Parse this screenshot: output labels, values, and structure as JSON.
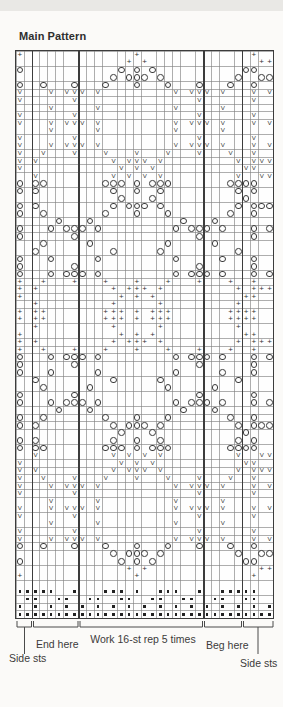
{
  "title": "Main Pattern",
  "labels": {
    "end_here": "End here",
    "repeat": "Work 16-st rep 5 times",
    "beg_here": "Beg here",
    "side_sts_left": "Side sts",
    "side_sts_right": "Side sts"
  },
  "chart_data": {
    "type": "knitting-chart",
    "title": "Main Pattern",
    "columns": 33,
    "rows": 75,
    "stitch_repeat": {
      "start_col": 9,
      "end_col": 24,
      "width_sts": 16,
      "label": "Work 16-st rep 5 times"
    },
    "side_stitches": {
      "left_cols": "1-2",
      "right_cols": "30-33"
    },
    "end_here_cols": "3-8",
    "beg_here_cols": "25-29",
    "bold_lines_after_cols": [
      2,
      8,
      24,
      29
    ],
    "symbol_key": {
      ".": "empty",
      "+": "plus-symbol",
      "o": "circle-symbol",
      "v": "v-symbol",
      "#": "dot-symbol"
    },
    "glyph_map": {
      "+": "+",
      "v": "V"
    },
    "grid_rows": [
      "+..............+..............+..",
      "..............+.+..............++",
      "o............o.o.o...........oo..",
      "............o.ooo.o.........o..oo",
      "o..o...o...o...o...o...o...o..o..",
      "v...v.vvv.v.........v.vvv.v...v.v",
      "v......v...............v......v..",
      "....v.....v.........v.....v......",
      "v......v...............v......v..",
      "v...v.vvv.v.........v.vvv.v...v.v",
      "....v.....v.........v.....v......",
      "v......v...............v......v..",
      "v...v.vvv.v.........v.vvv.v...v.v",
      "v..v...v...v...v...v...v...v..v..",
      "v.v.........v.vvv.v.........v.vvv",
      "v............v.v.v...........vv..",
      "..v.........v.v.v.v.........v..vv",
      "o.oo.......ooo.o.ooo.......oooo..",
      "o.o.........o..o..o.........o.o..",
      ".............o...o...........o...",
      "o.o.........o.ooo.o.........o.ooo",
      "o..o.......o...o...o.......o..o..",
      ".....o...o...........o...o.......",
      "o...o.ooo.o.........o.ooo.o...o.o",
      "o......o...............o......o..",
      "...o.....o.........o.....o.......",
      "..o.........o.....o.........o....",
      "o...o.....o.........o.....o...o..",
      "o......o...............o......o..",
      "o...o.ooo.o.........o.ooo.o...o.o",
      "+..+...+...+...+...+...+...+..+..",
      "+.+.........+.+++.+.........+.+++",
      "+............+.+.+...........++..",
      "..+.........+.....+.........+....",
      "+.++.......+++.+.+++.......++++..",
      "+.++.......+++.+.+++.......++++..",
      "..+.........+.....+.........+....",
      "+............+.+.+...........++..",
      "+.+.........+.+++.+.........+.+++",
      "+..+...+...+...+...+...+...+..+..",
      "o...o.ooo.o.........o.ooo.o...o.o",
      "o......o...............o......o..",
      "o...o.....o.........o.....o...o..",
      "..o.........o.....o.........o....",
      "...o.....o.........o.....o.......",
      "o......o...............o......o..",
      "o...o.ooo.o.........o.ooo.o...o.o",
      ".....o...o...........o...o.......",
      "o..o.......o...o...o.......o..o..",
      "o.o.........o.ooo.o.........o.ooo",
      ".............o...o...........o...",
      "o.o.........o..o..o.........o.o..",
      "o.oo.......ooo.o.ooo.......oooo..",
      "..v.........v.v.v.v.........v..vv",
      "v............v.v.v...........vv..",
      "v.v.........v.vvv.v.........v.vvv",
      "v..v...v...v...v...v...v...v..v..",
      "v...v.vvv.v.........v.vvv.v...v.v",
      "v......v...............v......v..",
      "....v.....v.........v.....v......",
      "v...v.vvv.v.........v.vvv.v...v.v",
      "v......v...............v......v..",
      "....v.....v.........v.....v......",
      "v......v...............v......v..",
      "v...v.vvv.v.........v.vvv.v...v.v",
      "o..o...o...o...o...o...o...o..o..",
      "............o.ooo.o.........o..oo",
      "o............o.o.o...........oo..",
      "..............+.+..............++",
      "+..............+..............+..",
      ".................................",
      "#####..#...###.#..###..#..#####..",
      ".##..##..##..##..##..##..##..##..",
      "#.#.#.#.#.#.#.#.#.#.#.#.#.#.#.#.#",
      "#################################"
    ]
  }
}
